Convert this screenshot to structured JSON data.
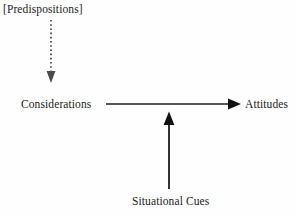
{
  "diagram": {
    "background_color": "#fefefe",
    "ink_color": "#1c1c1c",
    "nodes": [
      {
        "id": "predispositions",
        "label": "[Predispositions]",
        "x": 3,
        "y": 3
      },
      {
        "id": "considerations",
        "label": "Considerations",
        "x": 21,
        "y": 98
      },
      {
        "id": "attitudes",
        "label": "Attitudes",
        "x": 245,
        "y": 98
      },
      {
        "id": "situational_cues",
        "label": "Situational Cues",
        "x": 132,
        "y": 195
      }
    ],
    "edges": [
      {
        "id": "predispositions-to-considerations",
        "from": "predispositions",
        "to": "considerations",
        "style": "dotted",
        "direction": "down",
        "color": "#3a3a3a",
        "x1": 51,
        "y1": 20,
        "x2": 51,
        "y2": 82
      },
      {
        "id": "considerations-to-attitudes",
        "from": "considerations",
        "to": "attitudes",
        "style": "solid",
        "direction": "right",
        "color": "#1c1c1c",
        "x1": 106,
        "y1": 104,
        "x2": 241,
        "y2": 104
      },
      {
        "id": "situational-cues-to-considerations-attitudes",
        "from": "situational_cues",
        "to": "considerations-to-attitudes",
        "style": "solid",
        "direction": "up",
        "color": "#1c1c1c",
        "x1": 169,
        "y1": 189,
        "x2": 169,
        "y2": 112
      }
    ]
  }
}
